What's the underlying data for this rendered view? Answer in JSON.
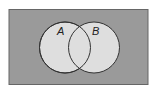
{
  "diagram": {
    "type": "venn",
    "universe": {
      "fill": "#9a9a9a",
      "stroke": "#555555"
    },
    "sets": [
      {
        "label": "A",
        "fill": "#dedede",
        "stroke": "#333333"
      },
      {
        "label": "B",
        "fill": "#dedede",
        "stroke": "#333333"
      }
    ]
  }
}
